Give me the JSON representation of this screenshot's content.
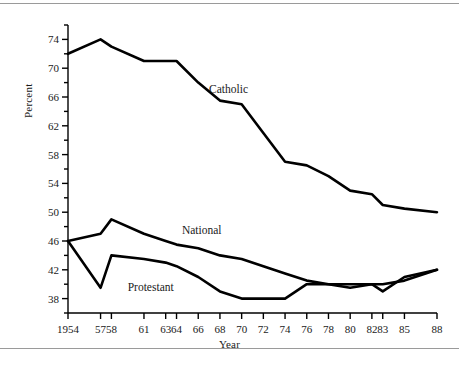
{
  "figure": {
    "background": "#ffffff",
    "line_color": "#000000",
    "axis_color": "#000000",
    "rule_color": "#9a9a9a"
  },
  "axes": {
    "xlabel": "Year",
    "ylabel": "Percent",
    "ylim": [
      36,
      76
    ],
    "xlim": [
      1954,
      1988
    ],
    "ytick_labels": [
      "38",
      "42",
      "46",
      "50",
      "54",
      "58",
      "62",
      "66",
      "70",
      "74"
    ],
    "ytick_values": [
      38,
      42,
      46,
      50,
      54,
      58,
      62,
      66,
      70,
      74
    ],
    "yminor_values": [
      36,
      40,
      44,
      48,
      52,
      56,
      60,
      64,
      68,
      72,
      76
    ],
    "xtick_labels": [
      "1954",
      "57",
      "58",
      "61",
      "63",
      "64",
      "66",
      "68",
      "70",
      "72",
      "74",
      "76",
      "78",
      "80",
      "82",
      "83",
      "85",
      "88"
    ],
    "xtick_values": [
      1954,
      1957,
      1958,
      1961,
      1963,
      1964,
      1966,
      1968,
      1970,
      1972,
      1974,
      1976,
      1978,
      1980,
      1982,
      1983,
      1985,
      1988
    ],
    "grid": false,
    "legend_position": "inline-annotations"
  },
  "chart_data": {
    "type": "line",
    "title": "",
    "subtitle": "",
    "xlabel": "Year",
    "ylabel": "Percent",
    "xlim": [
      1954,
      1988
    ],
    "ylim": [
      36,
      76
    ],
    "grid": false,
    "legend": [
      "Catholic",
      "National",
      "Protestant"
    ],
    "x": [
      1954,
      1957,
      1958,
      1961,
      1963,
      1964,
      1966,
      1968,
      1970,
      1972,
      1974,
      1976,
      1978,
      1980,
      1982,
      1983,
      1985,
      1988
    ],
    "series": [
      {
        "name": "Catholic",
        "color": "#000000",
        "values": [
          72,
          74,
          73,
          71,
          71,
          71,
          68,
          65.5,
          65,
          61,
          57,
          56.5,
          55,
          53,
          52.5,
          51,
          50.5,
          50
        ],
        "annotation": {
          "label": "Catholic",
          "x": 1967,
          "y": 66.5
        }
      },
      {
        "name": "National",
        "color": "#000000",
        "values": [
          46,
          47,
          49,
          47,
          46,
          45.5,
          45,
          44,
          43.5,
          42.5,
          41.5,
          40.5,
          40,
          40,
          40,
          40,
          40.5,
          42
        ],
        "annotation": {
          "label": "National",
          "x": 1964.5,
          "y": 47
        }
      },
      {
        "name": "Protestant",
        "color": "#000000",
        "values": [
          46,
          39.5,
          44,
          43.5,
          43,
          42.5,
          41,
          39,
          38,
          38,
          38,
          40,
          40,
          39.5,
          40,
          39,
          41,
          42
        ],
        "annotation": {
          "label": "Protestant",
          "x": 1959.5,
          "y": 39
        }
      }
    ]
  }
}
